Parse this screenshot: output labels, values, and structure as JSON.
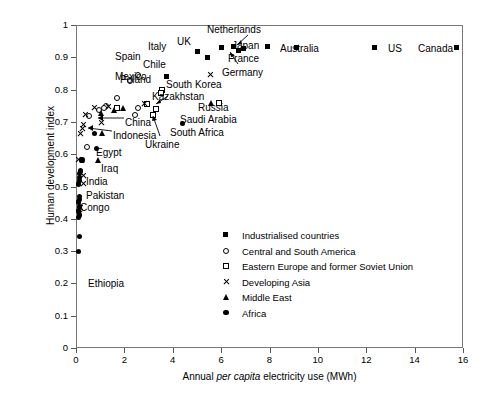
{
  "chart_data": {
    "type": "scatter",
    "title": "",
    "xlabel": "Annual per capita electricity use (MWh)",
    "xlabel_parts": {
      "pre": "Annual ",
      "italic": "per capita",
      "post": " electricity use (MWh)"
    },
    "ylabel": "Human development index",
    "xlim": [
      0,
      16
    ],
    "ylim": [
      0,
      1
    ],
    "xticks": [
      "0",
      "2",
      "4",
      "6",
      "8",
      "10",
      "12",
      "14",
      "16"
    ],
    "yticks": [
      "0",
      "0.1",
      "0.2",
      "0.3",
      "0.4",
      "0.5",
      "0.6",
      "0.7",
      "0.8",
      "0.9",
      "1"
    ],
    "grid": false,
    "legend_position": "lower-right-inside",
    "series": [
      {
        "name": "Industrialised countries",
        "key": "industrialised",
        "marker": "filled-square",
        "points": [
          {
            "label": "Spain",
            "x": 5.45,
            "y": 0.897
          },
          {
            "label": "Italy",
            "x": 5.05,
            "y": 0.915
          },
          {
            "label": "UK",
            "x": 6.05,
            "y": 0.928
          },
          {
            "label": "Netherlands",
            "x": 6.55,
            "y": 0.932
          },
          {
            "label": "France",
            "x": 6.95,
            "y": 0.925
          },
          {
            "label": "Germany",
            "x": 6.75,
            "y": 0.918
          },
          {
            "label": "Japan",
            "x": 7.95,
            "y": 0.933
          },
          {
            "label": "Australia",
            "x": 9.15,
            "y": 0.928
          },
          {
            "label": "US",
            "x": 12.35,
            "y": 0.929
          },
          {
            "label": "Canada",
            "x": 15.75,
            "y": 0.928
          },
          {
            "label": "",
            "x": 3.75,
            "y": 0.838
          }
        ]
      },
      {
        "name": "Central and South America",
        "key": "latin-america",
        "marker": "open-circle",
        "points": [
          {
            "label": "Chile",
            "x": 2.55,
            "y": 0.846
          },
          {
            "label": "Mexico",
            "x": 2.25,
            "y": 0.828
          },
          {
            "label": "",
            "x": 1.7,
            "y": 0.775
          },
          {
            "label": "",
            "x": 1.25,
            "y": 0.748
          },
          {
            "label": "",
            "x": 1.15,
            "y": 0.742
          },
          {
            "label": "",
            "x": 2.55,
            "y": 0.742
          },
          {
            "label": "",
            "x": 0.95,
            "y": 0.738
          },
          {
            "label": "",
            "x": 2.45,
            "y": 0.722
          },
          {
            "label": "",
            "x": 0.55,
            "y": 0.718
          },
          {
            "label": "",
            "x": 0.45,
            "y": 0.622
          }
        ]
      },
      {
        "name": "Eastern Europe and former Soviet Union",
        "key": "eastern-europe",
        "marker": "open-square",
        "points": [
          {
            "label": "Poland",
            "x": 3.55,
            "y": 0.8
          },
          {
            "label": "",
            "x": 3.5,
            "y": 0.788
          },
          {
            "label": "",
            "x": 2.95,
            "y": 0.755
          },
          {
            "label": "Kazakhstan",
            "x": 3.3,
            "y": 0.74
          },
          {
            "label": "Russia",
            "x": 5.9,
            "y": 0.757
          },
          {
            "label": "Ukraine",
            "x": 3.2,
            "y": 0.722
          },
          {
            "label": "",
            "x": 1.7,
            "y": 0.742
          }
        ]
      },
      {
        "name": "Developing Asia",
        "key": "developing-asia",
        "marker": "cross",
        "points": [
          {
            "label": "South Korea",
            "x": 5.55,
            "y": 0.845
          },
          {
            "label": "",
            "x": 2.85,
            "y": 0.757
          },
          {
            "label": "",
            "x": 1.35,
            "y": 0.748
          },
          {
            "label": "",
            "x": 0.75,
            "y": 0.745
          },
          {
            "label": "",
            "x": 0.4,
            "y": 0.722
          },
          {
            "label": "China",
            "x": 1.05,
            "y": 0.699
          },
          {
            "label": "",
            "x": 0.3,
            "y": 0.693
          },
          {
            "label": "",
            "x": 0.25,
            "y": 0.68
          },
          {
            "label": "",
            "x": 0.2,
            "y": 0.663
          },
          {
            "label": "",
            "x": 0.12,
            "y": 0.583
          },
          {
            "label": "India",
            "x": 0.3,
            "y": 0.535
          },
          {
            "label": "Pakistan",
            "x": 0.32,
            "y": 0.508
          },
          {
            "label": "",
            "x": 0.2,
            "y": 0.434
          },
          {
            "label": "",
            "x": 0.16,
            "y": 0.428
          }
        ]
      },
      {
        "name": "Middle East",
        "key": "middle-east",
        "marker": "triangle",
        "points": [
          {
            "label": "Saudi Arabia",
            "x": 5.6,
            "y": 0.757
          },
          {
            "label": "",
            "x": 1.95,
            "y": 0.741
          },
          {
            "label": "",
            "x": 1.6,
            "y": 0.735
          },
          {
            "label": "",
            "x": 1.05,
            "y": 0.727
          },
          {
            "label": "Indonesia",
            "x": 1.1,
            "y": 0.664
          },
          {
            "label": "Iraq",
            "x": 0.95,
            "y": 0.581
          }
        ]
      },
      {
        "name": "Africa",
        "key": "africa",
        "marker": "filled-circle",
        "points": [
          {
            "label": "South Africa",
            "x": 4.4,
            "y": 0.694
          },
          {
            "label": "",
            "x": 0.75,
            "y": 0.664
          },
          {
            "label": "Egypt",
            "x": 0.85,
            "y": 0.618
          },
          {
            "label": "",
            "x": 0.25,
            "y": 0.582
          },
          {
            "label": "",
            "x": 0.18,
            "y": 0.548
          },
          {
            "label": "",
            "x": 0.15,
            "y": 0.539
          },
          {
            "label": "",
            "x": 0.14,
            "y": 0.528
          },
          {
            "label": "",
            "x": 0.13,
            "y": 0.519
          },
          {
            "label": "Congo",
            "x": 0.12,
            "y": 0.508
          },
          {
            "label": "",
            "x": 0.14,
            "y": 0.47
          },
          {
            "label": "",
            "x": 0.13,
            "y": 0.461
          },
          {
            "label": "",
            "x": 0.12,
            "y": 0.452
          },
          {
            "label": "",
            "x": 0.14,
            "y": 0.437
          },
          {
            "label": "",
            "x": 0.12,
            "y": 0.424
          },
          {
            "label": "",
            "x": 0.13,
            "y": 0.412
          },
          {
            "label": "",
            "x": 0.12,
            "y": 0.404
          },
          {
            "label": "",
            "x": 0.14,
            "y": 0.345
          },
          {
            "label": "Ethiopia",
            "x": 0.12,
            "y": 0.3
          }
        ]
      }
    ],
    "annotations": [
      {
        "text": "Chile",
        "x": 143,
        "y": 59,
        "leader": false
      },
      {
        "text": "Mexico",
        "x": 115,
        "y": 71,
        "leader": false
      },
      {
        "text": "Spain",
        "x": 115,
        "y": 51,
        "leader": false
      },
      {
        "text": "Italy",
        "x": 148,
        "y": 41,
        "leader": false
      },
      {
        "text": "UK",
        "x": 177,
        "y": 36,
        "leader": false
      },
      {
        "text": "Netherlands",
        "x": 207,
        "y": 24,
        "leader": true
      },
      {
        "text": "Japan",
        "x": 232,
        "y": 40,
        "leader": false
      },
      {
        "text": "France",
        "x": 228,
        "y": 53,
        "leader": false
      },
      {
        "text": "Germany",
        "x": 222,
        "y": 67,
        "leader": true
      },
      {
        "text": "Australia",
        "x": 280,
        "y": 43,
        "leader": false
      },
      {
        "text": "US",
        "x": 388,
        "y": 43,
        "leader": false
      },
      {
        "text": "Canada",
        "x": 418,
        "y": 43,
        "leader": false
      },
      {
        "text": "Poland",
        "x": 120,
        "y": 74,
        "leader": false
      },
      {
        "text": "South Korea",
        "x": 166,
        "y": 79,
        "leader": false
      },
      {
        "text": "Kazakhstan",
        "x": 152,
        "y": 91,
        "leader": true
      },
      {
        "text": "Russia",
        "x": 198,
        "y": 102,
        "leader": false
      },
      {
        "text": "Saudi Arabia",
        "x": 180,
        "y": 114,
        "leader": false
      },
      {
        "text": "South Africa",
        "x": 170,
        "y": 127,
        "leader": false
      },
      {
        "text": "Ukraine",
        "x": 145,
        "y": 139,
        "leader": true
      },
      {
        "text": "China",
        "x": 125,
        "y": 117,
        "leader": true
      },
      {
        "text": "Indonesia",
        "x": 113,
        "y": 130,
        "leader": true
      },
      {
        "text": "Egypt",
        "x": 96,
        "y": 147,
        "leader": false
      },
      {
        "text": "Iraq",
        "x": 101,
        "y": 163,
        "leader": false
      },
      {
        "text": "India",
        "x": 86,
        "y": 176,
        "leader": false
      },
      {
        "text": "Pakistan",
        "x": 86,
        "y": 190,
        "leader": false
      },
      {
        "text": "Congo",
        "x": 80,
        "y": 202,
        "leader": false
      },
      {
        "text": "Ethiopia",
        "x": 88,
        "y": 278,
        "leader": false
      }
    ]
  },
  "legend": {
    "items": [
      {
        "label": "Industrialised countries",
        "marker": "filled-square"
      },
      {
        "label": "Central and South America",
        "marker": "open-circle"
      },
      {
        "label": "Eastern Europe and former Soviet Union",
        "marker": "open-square"
      },
      {
        "label": "Developing Asia",
        "marker": "cross"
      },
      {
        "label": "Middle East",
        "marker": "triangle"
      },
      {
        "label": "Africa",
        "marker": "filled-circle"
      }
    ]
  },
  "colors": {
    "foreground": "#000000",
    "axis": "#777777",
    "background": "#ffffff"
  }
}
